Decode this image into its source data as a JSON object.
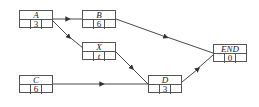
{
  "diagram": {
    "type": "activity-network",
    "nodes": [
      {
        "id": "A",
        "label": "A",
        "duration": "3",
        "x": 19,
        "y": 10,
        "w": 34,
        "h": 18
      },
      {
        "id": "B",
        "label": "B",
        "duration": "6",
        "x": 82,
        "y": 10,
        "w": 34,
        "h": 18
      },
      {
        "id": "X",
        "label": "X",
        "duration": "t",
        "x": 82,
        "y": 42,
        "w": 34,
        "h": 18
      },
      {
        "id": "C",
        "label": "C",
        "duration": "6",
        "x": 19,
        "y": 75,
        "w": 34,
        "h": 18
      },
      {
        "id": "D",
        "label": "D",
        "duration": "3",
        "x": 148,
        "y": 75,
        "w": 34,
        "h": 18
      },
      {
        "id": "END",
        "label": "END",
        "duration": "0",
        "x": 213,
        "y": 44,
        "w": 34,
        "h": 18
      }
    ],
    "edges": [
      {
        "from": "A",
        "to": "B"
      },
      {
        "from": "A",
        "to": "X"
      },
      {
        "from": "B",
        "to": "END"
      },
      {
        "from": "X",
        "to": "D"
      },
      {
        "from": "C",
        "to": "D"
      },
      {
        "from": "D",
        "to": "END"
      }
    ],
    "colors": {
      "line": "#333333",
      "box_border": "#555555"
    }
  }
}
